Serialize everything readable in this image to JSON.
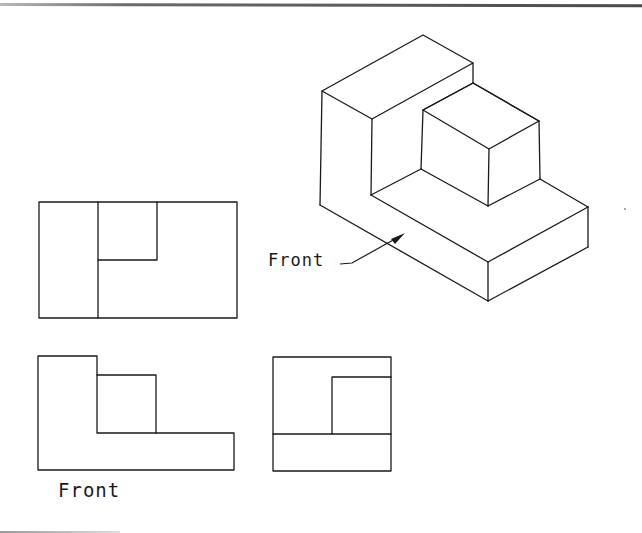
{
  "figure": {
    "type": "orthographic-projection-exercise",
    "colors": {
      "line": "#1a1a1a",
      "background": "#ffffff",
      "page_rule": "#5a5a5a"
    }
  },
  "isometric_view": {
    "label": "Front",
    "arrow_direction": "points to front face of the object"
  },
  "top_view": {
    "name": "Top view"
  },
  "front_view": {
    "name": "Front view",
    "label": "Front"
  },
  "side_view": {
    "name": "Right side view"
  }
}
